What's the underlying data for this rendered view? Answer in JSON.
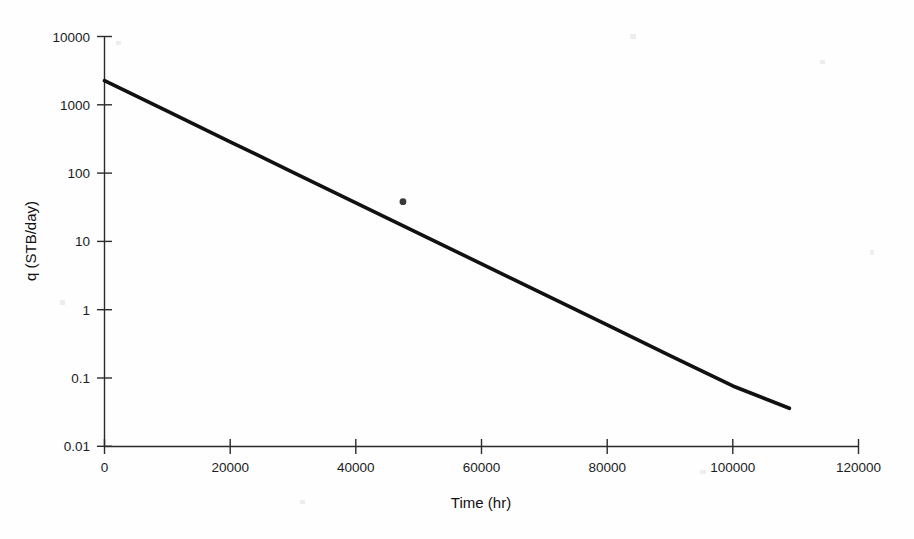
{
  "chart_data": {
    "type": "line",
    "title": "",
    "subtitle": "",
    "xlabel": "Time (hr)",
    "ylabel": "q (STB/day)",
    "yscale": "log",
    "xscale": "linear",
    "xlim": [
      0,
      120000
    ],
    "ylim": [
      0.01,
      10000
    ],
    "grid": false,
    "legend": false,
    "legend_position": "none",
    "xticks": [
      0,
      20000,
      40000,
      60000,
      80000,
      100000,
      120000
    ],
    "xtick_labels": [
      "0",
      "20000",
      "40000",
      "60000",
      "80000",
      "100000",
      "120000"
    ],
    "yticks": [
      0.01,
      0.1,
      1,
      10,
      100,
      1000,
      10000
    ],
    "ytick_labels": [
      "0.01",
      "0.1",
      "1",
      "10",
      "100",
      "1000",
      "10000"
    ],
    "series": [
      {
        "name": "exponential-decline",
        "kind": "line",
        "color": "#111111",
        "x": [
          0,
          10000,
          20000,
          30000,
          40000,
          50000,
          60000,
          70000,
          80000,
          90000,
          100000,
          109000
        ],
        "y": [
          2240,
          801,
          286,
          102.3,
          36.6,
          13.1,
          4.67,
          1.67,
          0.597,
          0.213,
          0.0763,
          0.036
        ]
      },
      {
        "name": "observed-point",
        "kind": "scatter",
        "color": "#3a3a3a",
        "x": [
          47500
        ],
        "y": [
          38
        ]
      }
    ],
    "annotations": []
  },
  "axes": {
    "x_axis_label": "Time (hr)",
    "y_axis_label": "q (STB/day)"
  },
  "ticks": {
    "x": [
      "0",
      "20000",
      "40000",
      "60000",
      "80000",
      "100000",
      "120000"
    ],
    "y": [
      "10000",
      "1000",
      "100",
      "10",
      "1",
      "0.1",
      "0.01"
    ]
  },
  "colors": {
    "line": "#111111",
    "point": "#3a3a3a",
    "axis": "#2b2b2b",
    "text": "#1c1c1c",
    "background": "#fefefe"
  }
}
